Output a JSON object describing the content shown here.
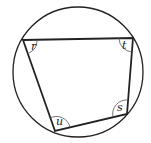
{
  "diagram": {
    "type": "cyclic quadrilateral inscribed in circle",
    "circle": {
      "cx": 78,
      "cy": 72,
      "r": 65
    },
    "vertices": {
      "r": {
        "x": 23,
        "y": 40
      },
      "t": {
        "x": 133,
        "y": 38
      },
      "s": {
        "x": 127,
        "y": 114
      },
      "u": {
        "x": 55,
        "y": 131
      }
    },
    "angle_labels": {
      "r": "r",
      "t": "t",
      "s": "s",
      "u": "u"
    },
    "colors": {
      "stroke": "#222222",
      "background": "#ffffff"
    }
  }
}
